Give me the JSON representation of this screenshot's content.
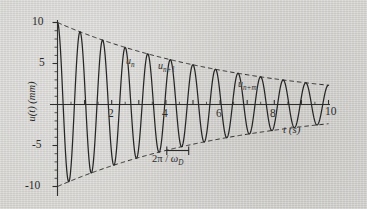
{
  "figure": {
    "kind": "damped-free-vibration-plot",
    "background_color": "#d7d6d3",
    "ink_color": "#2b2b2b"
  },
  "axes": {
    "y_title": "u(t) (mm)",
    "y_title_var": "u(t)",
    "y_title_unit": "(mm)",
    "x_title": "t (s)",
    "y_ticks": [
      "10",
      "5",
      "-5",
      "-10"
    ],
    "x_ticks": [
      "2",
      "4",
      "6",
      "8",
      "10"
    ]
  },
  "annotations": {
    "peak_n": "u",
    "peak_n_sub": "n",
    "peak_n1": "u",
    "peak_n1_sub": "n+1",
    "peak_nm": "u",
    "peak_nm_sub": "n+m",
    "period_pre": "2π / ",
    "period_omega": "ω",
    "period_sub": "D"
  },
  "chart_data": {
    "type": "line",
    "title": "",
    "xlabel": "t (s)",
    "ylabel": "u(t) (mm)",
    "xlim": [
      0,
      10.6
    ],
    "ylim": [
      -11.5,
      11.5
    ],
    "grid": false,
    "legend": "none",
    "xticks": [
      0,
      1,
      2,
      3,
      4,
      5,
      6,
      7,
      8,
      9,
      10
    ],
    "xticklabels": [
      "",
      "",
      "2",
      "",
      "4",
      "",
      "6",
      "",
      "8",
      "",
      "10"
    ],
    "yticks": [
      10,
      5,
      0,
      -5,
      -10
    ],
    "yticklabels": [
      "10",
      "5",
      "",
      "-5",
      "-10"
    ],
    "model": {
      "equation": "u(t) = u0 * exp(-zeta*omega_n*t) * cos(omega_D*t)",
      "u0_mm": 10,
      "decay_rate_per_s": 0.145,
      "period_s": 0.833,
      "omega_D_rad_per_s": 7.54,
      "num_cycles_shown": 12
    },
    "series": [
      {
        "name": "u(t)",
        "style": "solid",
        "description": "damped sinusoid, 12 cycles from t=0 to t=10"
      },
      {
        "name": "+envelope",
        "style": "dashed",
        "description": "10*exp(-0.145*t)",
        "points": [
          [
            0,
            10.0
          ],
          [
            1,
            8.65
          ],
          [
            2,
            7.48
          ],
          [
            3,
            6.47
          ],
          [
            4,
            5.6
          ],
          [
            5,
            4.84
          ],
          [
            6,
            4.19
          ],
          [
            7,
            3.62
          ],
          [
            8,
            3.13
          ],
          [
            9,
            2.71
          ],
          [
            10,
            2.34
          ]
        ]
      },
      {
        "name": "-envelope",
        "style": "dashed",
        "description": "-10*exp(-0.145*t)",
        "points": [
          [
            0,
            -10.0
          ],
          [
            1,
            -8.65
          ],
          [
            2,
            -7.48
          ],
          [
            3,
            -6.47
          ],
          [
            4,
            -5.6
          ],
          [
            5,
            -4.84
          ],
          [
            6,
            -4.19
          ],
          [
            7,
            -3.62
          ],
          [
            8,
            -3.13
          ],
          [
            9,
            -2.71
          ],
          [
            10,
            -2.34
          ]
        ]
      }
    ],
    "marked_peaks": [
      {
        "label": "u_n",
        "t": 3.33,
        "u": 6.2
      },
      {
        "label": "u_{n+1}",
        "t": 4.17,
        "u": 5.45
      },
      {
        "label": "u_{n+m}",
        "t": 6.67,
        "u": 3.8
      }
    ],
    "period_bracket": {
      "label": "2π / ω_D",
      "from_t": 4.0,
      "to_t": 4.83
    }
  }
}
